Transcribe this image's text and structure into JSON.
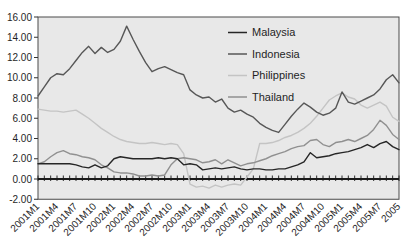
{
  "figure": {
    "width": 405,
    "height": 252,
    "page_background": "#ffffff",
    "plot_background": "#e8e8e8",
    "frame_color": "#4a4a4a",
    "zero_line_color": "#1a1a1a",
    "tick_color": "#333333",
    "label_color": "#1f1f1f"
  },
  "chart_data": {
    "type": "line",
    "title": "",
    "xlabel": "",
    "ylabel": "",
    "grid": false,
    "legend_position": "upper right",
    "ylim": [
      -2,
      16
    ],
    "y_tick_labels": [
      "16.00",
      "14.00",
      "12.00",
      "10.00",
      "8.00",
      "6.00",
      "4.00",
      "2.00",
      "0.00",
      "-2.00"
    ],
    "y_tick_values": [
      16,
      14,
      12,
      10,
      8,
      6,
      4,
      2,
      0,
      -2
    ],
    "x": [
      "2001M1",
      "2001M2",
      "2001M3",
      "2001M4",
      "2001M5",
      "2001M6",
      "2001M7",
      "2001M8",
      "2001M9",
      "2001M10",
      "2001M11",
      "2001M12",
      "2002M1",
      "2002M2",
      "2002M3",
      "2002M4",
      "2002M5",
      "2002M6",
      "2002M7",
      "2002M8",
      "2002M9",
      "2002M10",
      "2002M11",
      "2002M12",
      "2003M1",
      "2003M2",
      "2003M3",
      "2003M4",
      "2003M5",
      "2003M6",
      "2003M7",
      "2003M8",
      "2003M9",
      "2003M10",
      "2003M11",
      "2003M12",
      "2004M1",
      "2004M2",
      "2004M3",
      "2004M4",
      "2004M5",
      "2004M6",
      "2004M7",
      "2004M8",
      "2004M9",
      "2004M10",
      "2004M11",
      "2004M12",
      "2005M1",
      "2005M2",
      "2005M3",
      "2005M4",
      "2005M5",
      "2005M6",
      "2005M7",
      "2005M8",
      "2005M9",
      "2005M10"
    ],
    "x_tick_labels": [
      "2001M1",
      "2001M4",
      "2001M7",
      "2001M10",
      "2002M1",
      "2002M4",
      "2002M7",
      "2002M10",
      "2003M1",
      "2003M4",
      "2003M7",
      "2003M10",
      "2004M1",
      "2004M4",
      "2004M7",
      "2004M10",
      "2005M1",
      "2005M4",
      "2005M7",
      "2005"
    ],
    "x_tick_every_n_months": 3,
    "series": [
      {
        "name": "Malaysia",
        "color": "#262626",
        "values": [
          1.5,
          1.5,
          1.5,
          1.5,
          1.5,
          1.5,
          1.4,
          1.2,
          1.1,
          1.4,
          1.1,
          1.3,
          2.0,
          2.2,
          2.1,
          2.0,
          2.0,
          2.0,
          2.0,
          2.1,
          2.0,
          2.1,
          2.0,
          1.4,
          1.5,
          1.4,
          0.9,
          1.0,
          1.1,
          1.0,
          1.1,
          1.2,
          1.0,
          0.9,
          1.0,
          1.0,
          0.9,
          0.9,
          1.0,
          1.0,
          1.2,
          1.4,
          1.7,
          2.6,
          2.1,
          2.2,
          2.3,
          2.5,
          2.6,
          2.7,
          2.9,
          3.1,
          3.4,
          3.1,
          3.5,
          3.7,
          3.2,
          2.9
        ]
      },
      {
        "name": "Indonesia",
        "color": "#575757",
        "values": [
          8.2,
          9.1,
          10.0,
          10.4,
          10.3,
          10.9,
          11.7,
          12.5,
          13.1,
          12.4,
          13.0,
          12.5,
          12.8,
          13.6,
          15.1,
          13.8,
          12.6,
          11.5,
          10.6,
          10.9,
          11.1,
          10.8,
          10.5,
          10.3,
          8.8,
          8.3,
          8.0,
          8.1,
          7.6,
          7.9,
          7.0,
          6.6,
          6.8,
          6.4,
          6.1,
          5.5,
          5.1,
          4.8,
          4.6,
          5.4,
          6.2,
          6.9,
          7.5,
          7.1,
          6.6,
          6.3,
          6.5,
          7.0,
          8.6,
          7.6,
          7.4,
          7.7,
          8.0,
          8.3,
          8.9,
          9.8,
          10.3,
          9.5
        ]
      },
      {
        "name": "Philippines",
        "color": "#c4c4c4",
        "values": [
          6.9,
          6.8,
          6.7,
          6.7,
          6.6,
          6.7,
          6.8,
          6.4,
          6.0,
          5.5,
          5.0,
          4.6,
          4.2,
          3.9,
          3.7,
          3.6,
          3.5,
          3.5,
          3.6,
          3.5,
          3.4,
          3.5,
          3.4,
          2.5,
          -0.5,
          -0.8,
          -0.7,
          -0.9,
          -0.6,
          -0.8,
          -0.6,
          -0.5,
          -0.6,
          0.2,
          1.0,
          3.5,
          3.5,
          3.6,
          3.8,
          4.1,
          4.3,
          4.6,
          5.0,
          5.5,
          6.2,
          7.0,
          7.8,
          8.2,
          8.5,
          8.1,
          7.9,
          7.3,
          7.0,
          7.3,
          7.6,
          7.2,
          6.1,
          5.7
        ]
      },
      {
        "name": "Thailand",
        "color": "#909090",
        "values": [
          1.5,
          1.7,
          2.2,
          2.6,
          2.8,
          2.5,
          2.4,
          2.2,
          2.1,
          1.9,
          1.4,
          1.1,
          0.7,
          0.6,
          0.6,
          0.5,
          0.3,
          0.3,
          0.4,
          0.3,
          0.4,
          1.4,
          2.0,
          2.1,
          2.0,
          1.9,
          1.6,
          1.7,
          1.9,
          1.5,
          1.9,
          1.6,
          1.3,
          1.5,
          1.6,
          1.8,
          2.0,
          2.3,
          2.5,
          2.7,
          3.0,
          3.2,
          3.3,
          3.8,
          3.9,
          3.4,
          3.2,
          3.6,
          3.7,
          3.9,
          3.7,
          4.0,
          4.3,
          4.9,
          5.8,
          5.3,
          4.4,
          3.9
        ]
      }
    ]
  },
  "legend": {
    "items": [
      {
        "label": "Malaysia",
        "color": "#262626"
      },
      {
        "label": "Indonesia",
        "color": "#575757"
      },
      {
        "label": "Philippines",
        "color": "#c4c4c4"
      },
      {
        "label": "Thailand",
        "color": "#909090"
      }
    ]
  }
}
